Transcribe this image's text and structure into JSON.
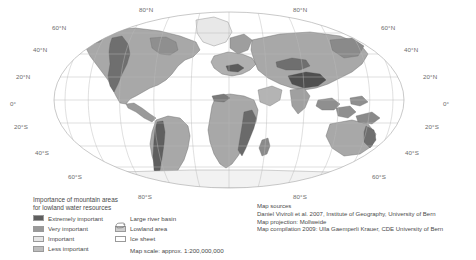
{
  "map": {
    "projection_name": "Mollweide",
    "graticule_labels": {
      "left": [
        {
          "text": "60°N",
          "x": 60,
          "y": 27
        },
        {
          "text": "40°N",
          "x": 40,
          "y": 49
        },
        {
          "text": "20°N",
          "x": 20,
          "y": 76
        },
        {
          "text": "0°",
          "x": 12,
          "y": 104
        },
        {
          "text": "20°S",
          "x": 18,
          "y": 126
        },
        {
          "text": "40°S",
          "x": 42,
          "y": 152
        },
        {
          "text": "60°S",
          "x": 75,
          "y": 176
        }
      ],
      "right": [
        {
          "text": "60°N",
          "x": 386,
          "y": 27
        },
        {
          "text": "40°N",
          "x": 409,
          "y": 49
        },
        {
          "text": "20°N",
          "x": 428,
          "y": 76
        },
        {
          "text": "0°",
          "x": 447,
          "y": 104
        },
        {
          "text": "20°S",
          "x": 430,
          "y": 126
        },
        {
          "text": "40°S",
          "x": 410,
          "y": 152
        },
        {
          "text": "60°S",
          "x": 378,
          "y": 176
        }
      ],
      "top": [
        {
          "text": "80°N",
          "x": 144,
          "y": 9
        },
        {
          "text": "80°N",
          "x": 298,
          "y": 9
        }
      ],
      "bottom": [
        {
          "text": "80°S",
          "x": 143,
          "y": 196
        },
        {
          "text": "80°S",
          "x": 298,
          "y": 196
        }
      ]
    }
  },
  "legend": {
    "title_line1": "Importance of mountain areas",
    "title_line2": "for lowland water resources",
    "classes": [
      {
        "label": "Extremely important",
        "color": "#5e5e5e"
      },
      {
        "label": "Very important",
        "color": "#9a9a9a"
      },
      {
        "label": "Important",
        "color": "#e0e0e0"
      },
      {
        "label": "Less important",
        "color": "#bdbdbd"
      }
    ],
    "symbols": [
      {
        "label": "Large river basin",
        "icon": "river-basin-outline-icon"
      },
      {
        "label": "Lowland area",
        "icon": "lowland-area-swatch-icon"
      },
      {
        "label": "Ice sheet",
        "icon": "ice-sheet-outline-icon"
      }
    ],
    "scale_text": "Map scale: approx. 1:200,000,000"
  },
  "sources": {
    "heading": "Map sources",
    "lines": [
      "Daniel Viviroli et al. 2007, Institute of Geography, University of Bern",
      "Map projection: Mollweide",
      "Map compilation 2009: Ulla Gaemperli Krauer, CDE University of Bern"
    ]
  }
}
